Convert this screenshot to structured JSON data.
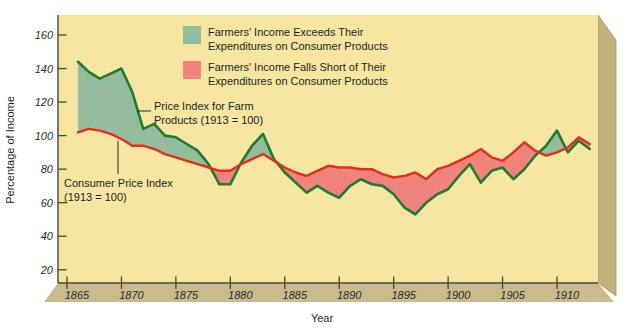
{
  "page": {
    "background": "#ffffff"
  },
  "panel": {
    "face_color": "#f6e6a1",
    "bottom_face_color": "#c9bc8c",
    "side_face_color": "#c2b17c",
    "edge_color": "#a89a62"
  },
  "annotations": {
    "farm_label_line1": "Price Index for Farm",
    "farm_label_line2": "Products (1913 = 100)",
    "cpi_label_line1": "Consumer Price Index",
    "cpi_label_line2": "(1913 = 100)"
  },
  "chart_data": {
    "type": "area",
    "title": "",
    "xlabel": "Year",
    "ylabel": "Percentage of Income",
    "grid": false,
    "x_ticks": [
      1865,
      1870,
      1875,
      1880,
      1885,
      1890,
      1895,
      1900,
      1905,
      1910
    ],
    "y_ticks": [
      160,
      140,
      120,
      100,
      80,
      60,
      40,
      20
    ],
    "x_range": [
      1864.2,
      1914.5
    ],
    "y_range": [
      12,
      172
    ],
    "years": [
      1866,
      1867,
      1868,
      1869,
      1870,
      1871,
      1872,
      1873,
      1874,
      1875,
      1876,
      1877,
      1878,
      1879,
      1880,
      1881,
      1882,
      1883,
      1884,
      1885,
      1886,
      1887,
      1888,
      1889,
      1890,
      1891,
      1892,
      1893,
      1894,
      1895,
      1896,
      1897,
      1898,
      1899,
      1900,
      1901,
      1902,
      1903,
      1904,
      1905,
      1906,
      1907,
      1908,
      1909,
      1910,
      1911,
      1912,
      1913
    ],
    "series": [
      {
        "name": "Price Index for Farm Products (1913 = 100)",
        "line_color": "#1e7b31",
        "values": [
          144,
          138,
          134,
          137,
          140,
          126,
          104,
          107,
          100,
          99,
          95,
          91,
          83,
          71,
          71,
          84,
          94,
          101,
          86,
          78,
          72,
          66,
          70,
          66,
          63,
          70,
          74,
          71,
          70,
          65,
          57,
          53,
          60,
          65,
          68,
          76,
          83,
          72,
          79,
          81,
          74,
          80,
          88,
          94,
          103,
          90,
          97,
          92
        ]
      },
      {
        "name": "Consumer Price Index (1913 = 100)",
        "line_color": "#e52d1d",
        "values": [
          102,
          104,
          103,
          101,
          98,
          94,
          94,
          92,
          89,
          87,
          85,
          83,
          81,
          79,
          79,
          83,
          86,
          89,
          85,
          81,
          78,
          76,
          79,
          82,
          81,
          81,
          80,
          80,
          77,
          75,
          76,
          78,
          74,
          80,
          82,
          85,
          88,
          92,
          87,
          85,
          90,
          96,
          91,
          88,
          90,
          93,
          99,
          95
        ]
      }
    ],
    "regions_legend": [
      {
        "line1": "Farmers' Income Exceeds Their",
        "line2": "Expenditures on Consumer Products",
        "fill_color": "#93bd9d"
      },
      {
        "line1": "Farmers' Income Falls Short of Their",
        "line2": "Expenditures on Consumer Products",
        "fill_color": "#f0837c"
      }
    ],
    "legend_position": "top-center-inside"
  }
}
